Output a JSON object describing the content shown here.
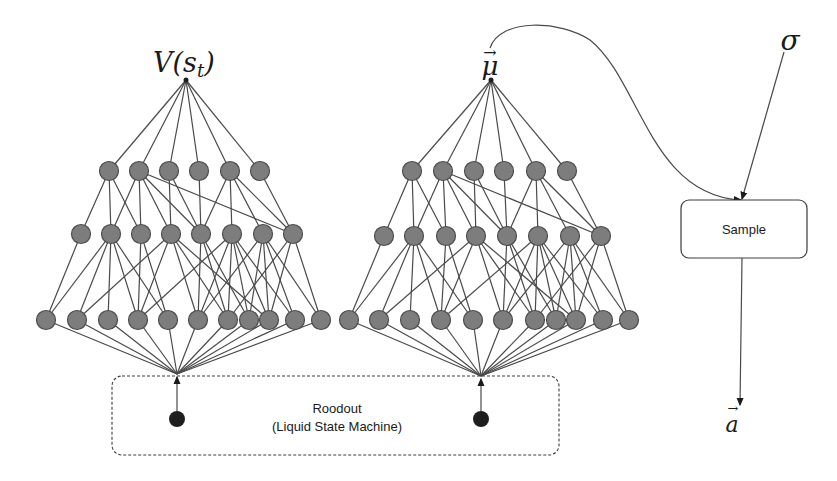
{
  "figure": {
    "background": "#ffffff",
    "ink": "#1a1a1a",
    "node_fill": "#7d7d7d",
    "node_stroke": "#4c4c4c",
    "edge_color": "#4a4a4a"
  },
  "labels": {
    "value_output": "V(s",
    "value_output_sub": "t",
    "value_output_close": ")",
    "mean_output": "μ",
    "mean_arrow": "→",
    "sigma": "σ",
    "action": "a",
    "action_arrow": "→",
    "sample_box": "Sample",
    "readout_title": "Roodout",
    "readout_subtitle": "(Liquid State Machine)"
  },
  "networks": [
    {
      "name": "value-network",
      "output_label": "V(s_t)",
      "apex": [
        186,
        80
      ],
      "top_layer_y": 171,
      "top_layer_x": [
        109,
        139,
        169,
        199,
        230,
        260
      ],
      "mid_layer_y": 234,
      "mid_layer_x": [
        81,
        111,
        141,
        171,
        201,
        232,
        263,
        293
      ],
      "bottom_layer_y": 320,
      "bottom_layer_x": [
        46,
        77,
        108,
        138,
        168,
        198,
        228,
        249,
        269,
        295,
        321
      ],
      "input": [
        177,
        374
      ],
      "input_node": [
        177,
        419
      ]
    },
    {
      "name": "policy-mean-network",
      "output_label": "μ",
      "apex": [
        491,
        80
      ],
      "top_layer_y": 171,
      "top_layer_x": [
        412,
        443,
        474,
        504,
        536,
        567
      ],
      "mid_layer_y": 236,
      "mid_layer_x": [
        384,
        414,
        446,
        476,
        507,
        538,
        570,
        601
      ],
      "bottom_layer_y": 320,
      "bottom_layer_x": [
        349,
        379,
        410,
        441,
        473,
        503,
        535,
        556,
        576,
        603,
        629
      ],
      "input": [
        481,
        376
      ],
      "input_node": [
        481,
        419
      ]
    }
  ],
  "connectivity": {
    "top_to_mid": [
      [
        0,
        0
      ],
      [
        0,
        1
      ],
      [
        0,
        2
      ],
      [
        1,
        1
      ],
      [
        1,
        2
      ],
      [
        1,
        3
      ],
      [
        1,
        4
      ],
      [
        1,
        7
      ],
      [
        2,
        3
      ],
      [
        2,
        4
      ],
      [
        3,
        4
      ],
      [
        4,
        4
      ],
      [
        4,
        5
      ],
      [
        4,
        6
      ],
      [
        4,
        7
      ],
      [
        5,
        7
      ]
    ],
    "mid_to_bottom": [
      [
        0,
        0
      ],
      [
        1,
        0
      ],
      [
        1,
        1
      ],
      [
        1,
        2
      ],
      [
        1,
        3
      ],
      [
        1,
        4
      ],
      [
        2,
        3
      ],
      [
        2,
        4
      ],
      [
        3,
        1
      ],
      [
        3,
        3
      ],
      [
        3,
        5
      ],
      [
        3,
        6
      ],
      [
        3,
        8
      ],
      [
        4,
        5
      ],
      [
        4,
        6
      ],
      [
        4,
        7
      ],
      [
        5,
        3
      ],
      [
        5,
        5
      ],
      [
        5,
        6
      ],
      [
        5,
        7
      ],
      [
        5,
        8
      ],
      [
        5,
        9
      ],
      [
        6,
        5
      ],
      [
        6,
        7
      ],
      [
        6,
        8
      ],
      [
        6,
        9
      ],
      [
        6,
        10
      ],
      [
        7,
        6
      ],
      [
        7,
        8
      ],
      [
        7,
        10
      ]
    ]
  },
  "readout_box": {
    "x": 112,
    "y": 376,
    "w": 447,
    "h": 79,
    "style": "dashed"
  },
  "sample_box": {
    "x": 681,
    "y": 200,
    "w": 126,
    "h": 58
  },
  "sigma_pos": [
    790,
    42
  ],
  "action_pos": [
    731,
    428
  ],
  "mean_curve": "M 490 48 C 500 18, 560 20, 590 40 C 640 80, 650 195, 741 200"
}
